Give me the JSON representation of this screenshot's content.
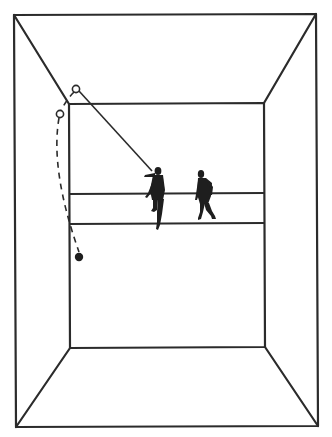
{
  "diagram": {
    "type": "court-perspective",
    "colors": {
      "background": "#ffffff",
      "ink": "#2b2b2b",
      "figure": "#1e1e1e"
    },
    "outer_frame": {
      "tl": [
        14,
        15
      ],
      "tr": [
        316,
        14
      ],
      "br": [
        318,
        426
      ],
      "bl": [
        16,
        427
      ]
    },
    "front_wall": {
      "tl": [
        69,
        104
      ],
      "tr": [
        264,
        103
      ],
      "br": [
        265,
        347
      ],
      "bl": [
        70,
        348
      ]
    },
    "floor_lines": [
      {
        "name": "short-line",
        "y": 194
      },
      {
        "name": "service-line",
        "y": 224
      }
    ],
    "ball_positions": [
      {
        "name": "ball-contact-ceiling",
        "x": 76,
        "y": 89,
        "style": "open"
      },
      {
        "name": "ball-rebound",
        "x": 60,
        "y": 114,
        "style": "open"
      },
      {
        "name": "ball-final",
        "x": 79,
        "y": 257,
        "style": "filled"
      }
    ],
    "trajectories": [
      {
        "name": "shot-path",
        "style": "solid",
        "from": [
          152,
          172
        ],
        "to": [
          76,
          89
        ]
      },
      {
        "name": "rebound-path",
        "style": "dashed",
        "from": [
          60,
          114
        ],
        "to": [
          79,
          257
        ]
      }
    ],
    "players": [
      {
        "name": "player-hitting",
        "x": 157,
        "y": 195
      },
      {
        "name": "player-waiting",
        "x": 207,
        "y": 193
      }
    ]
  }
}
